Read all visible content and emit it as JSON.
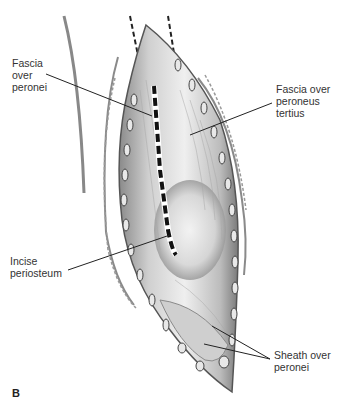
{
  "figure": {
    "panel_letter": "B",
    "labels": [
      {
        "id": "fascia-over-peronei",
        "text": "Fascia\nover\nperonei",
        "x": 12,
        "y": 57
      },
      {
        "id": "fascia-over-peroneus-tertius",
        "text": "Fascia over\nperoneus\ntertius",
        "x": 276,
        "y": 83
      },
      {
        "id": "incise-periosteum",
        "text": "Incise\nperiosteum",
        "x": 10,
        "y": 255
      },
      {
        "id": "sheath-over-peronei",
        "text": "Sheath over\nperonei",
        "x": 274,
        "y": 349
      }
    ],
    "colors": {
      "line": "#222222",
      "tissue_light": "#e6e6e6",
      "tissue_mid": "#bdbdbd",
      "tissue_dark": "#6e6e6e",
      "text": "#333333"
    }
  }
}
